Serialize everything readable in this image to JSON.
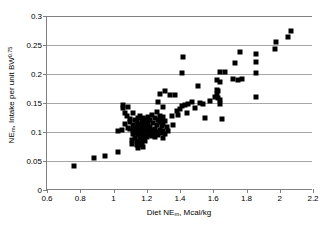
{
  "chart_data": {
    "type": "scatter",
    "title": "",
    "xlabel": "Diet NEm, Mcal/kg",
    "ylabel": "NEm Intake per unit BW0.75",
    "xlabel_parts": {
      "pre": "Diet NE",
      "sub": "m",
      "post": ", Mcal/kg"
    },
    "ylabel_parts": {
      "pre": "NE",
      "sub": "m",
      "mid": ", Intake per unit BW",
      "sup": "0.75"
    },
    "xlim": [
      0.6,
      2.2
    ],
    "ylim": [
      0,
      0.3
    ],
    "xticks": [
      0.6,
      0.8,
      1,
      1.2,
      1.4,
      1.6,
      1.8,
      2,
      2.2
    ],
    "xtick_labels": [
      "0.6",
      "0.8",
      "1",
      "1.2",
      "1.4",
      "1.6",
      "1.8",
      "2",
      "2.2"
    ],
    "yticks": [
      0,
      0.05,
      0.1,
      0.15,
      0.2,
      0.25,
      0.3
    ],
    "ytick_labels": [
      "0",
      "0.05",
      "0.1",
      "0.15",
      "0.2",
      "0.25",
      "0.3"
    ],
    "grid": "horizontal",
    "legend": null,
    "marker": "square",
    "marker_color": "#000000",
    "marker_size_px": 5,
    "gridline_color": "#a6a6a6",
    "axis_color": "#808080",
    "n_points": 139,
    "points": [
      [
        0.76,
        0.041
      ],
      [
        0.88,
        0.056
      ],
      [
        0.95,
        0.058
      ],
      [
        1.03,
        0.066
      ],
      [
        1.03,
        0.102
      ],
      [
        1.05,
        0.103
      ],
      [
        1.06,
        0.141
      ],
      [
        1.06,
        0.146
      ],
      [
        1.07,
        0.132
      ],
      [
        1.07,
        0.113
      ],
      [
        1.08,
        0.127
      ],
      [
        1.09,
        0.107
      ],
      [
        1.09,
        0.143
      ],
      [
        1.1,
        0.106
      ],
      [
        1.1,
        0.118
      ],
      [
        1.1,
        0.123
      ],
      [
        1.11,
        0.086
      ],
      [
        1.11,
        0.079
      ],
      [
        1.12,
        0.096
      ],
      [
        1.12,
        0.104
      ],
      [
        1.12,
        0.112
      ],
      [
        1.12,
        0.133
      ],
      [
        1.13,
        0.09
      ],
      [
        1.13,
        0.101
      ],
      [
        1.13,
        0.108
      ],
      [
        1.13,
        0.12
      ],
      [
        1.14,
        0.078
      ],
      [
        1.14,
        0.085
      ],
      [
        1.14,
        0.098
      ],
      [
        1.14,
        0.106
      ],
      [
        1.14,
        0.117
      ],
      [
        1.15,
        0.073
      ],
      [
        1.15,
        0.082
      ],
      [
        1.15,
        0.094
      ],
      [
        1.15,
        0.102
      ],
      [
        1.15,
        0.11
      ],
      [
        1.15,
        0.124
      ],
      [
        1.16,
        0.077
      ],
      [
        1.16,
        0.089
      ],
      [
        1.16,
        0.099
      ],
      [
        1.16,
        0.105
      ],
      [
        1.16,
        0.113
      ],
      [
        1.16,
        0.128
      ],
      [
        1.17,
        0.081
      ],
      [
        1.17,
        0.092
      ],
      [
        1.17,
        0.1
      ],
      [
        1.17,
        0.108
      ],
      [
        1.17,
        0.119
      ],
      [
        1.18,
        0.075
      ],
      [
        1.18,
        0.087
      ],
      [
        1.18,
        0.097
      ],
      [
        1.18,
        0.104
      ],
      [
        1.18,
        0.115
      ],
      [
        1.18,
        0.125
      ],
      [
        1.19,
        0.084
      ],
      [
        1.19,
        0.093
      ],
      [
        1.19,
        0.103
      ],
      [
        1.19,
        0.111
      ],
      [
        1.19,
        0.122
      ],
      [
        1.2,
        0.091
      ],
      [
        1.2,
        0.101
      ],
      [
        1.2,
        0.109
      ],
      [
        1.2,
        0.118
      ],
      [
        1.21,
        0.095
      ],
      [
        1.21,
        0.105
      ],
      [
        1.21,
        0.114
      ],
      [
        1.21,
        0.126
      ],
      [
        1.22,
        0.099
      ],
      [
        1.22,
        0.108
      ],
      [
        1.22,
        0.121
      ],
      [
        1.23,
        0.093
      ],
      [
        1.23,
        0.103
      ],
      [
        1.23,
        0.13
      ],
      [
        1.24,
        0.098
      ],
      [
        1.24,
        0.116
      ],
      [
        1.25,
        0.091
      ],
      [
        1.25,
        0.106
      ],
      [
        1.25,
        0.124
      ],
      [
        1.26,
        0.1
      ],
      [
        1.26,
        0.112
      ],
      [
        1.26,
        0.134
      ],
      [
        1.27,
        0.095
      ],
      [
        1.27,
        0.121
      ],
      [
        1.27,
        0.152
      ],
      [
        1.28,
        0.104
      ],
      [
        1.28,
        0.117
      ],
      [
        1.28,
        0.128
      ],
      [
        1.28,
        0.166
      ],
      [
        1.29,
        0.098
      ],
      [
        1.29,
        0.11
      ],
      [
        1.29,
        0.123
      ],
      [
        1.3,
        0.09
      ],
      [
        1.3,
        0.102
      ],
      [
        1.3,
        0.114
      ],
      [
        1.3,
        0.126
      ],
      [
        1.3,
        0.143
      ],
      [
        1.31,
        0.096
      ],
      [
        1.31,
        0.119
      ],
      [
        1.31,
        0.171
      ],
      [
        1.32,
        0.108
      ],
      [
        1.33,
        0.101
      ],
      [
        1.34,
        0.163
      ],
      [
        1.35,
        0.128
      ],
      [
        1.36,
        0.112
      ],
      [
        1.37,
        0.164
      ],
      [
        1.38,
        0.136
      ],
      [
        1.39,
        0.13
      ],
      [
        1.4,
        0.14
      ],
      [
        1.41,
        0.144
      ],
      [
        1.41,
        0.201
      ],
      [
        1.42,
        0.23
      ],
      [
        1.43,
        0.146
      ],
      [
        1.44,
        0.133
      ],
      [
        1.45,
        0.149
      ],
      [
        1.47,
        0.152
      ],
      [
        1.49,
        0.141
      ],
      [
        1.51,
        0.179
      ],
      [
        1.52,
        0.15
      ],
      [
        1.54,
        0.148
      ],
      [
        1.55,
        0.125
      ],
      [
        1.58,
        0.153
      ],
      [
        1.61,
        0.16
      ],
      [
        1.62,
        0.173
      ],
      [
        1.62,
        0.166
      ],
      [
        1.62,
        0.19
      ],
      [
        1.63,
        0.158
      ],
      [
        1.63,
        0.17
      ],
      [
        1.64,
        0.148
      ],
      [
        1.64,
        0.155
      ],
      [
        1.64,
        0.187
      ],
      [
        1.64,
        0.203
      ],
      [
        1.65,
        0.122
      ],
      [
        1.67,
        0.203
      ],
      [
        1.72,
        0.192
      ],
      [
        1.73,
        0.219
      ],
      [
        1.75,
        0.19
      ],
      [
        1.76,
        0.238
      ],
      [
        1.77,
        0.191
      ],
      [
        1.86,
        0.161
      ],
      [
        1.86,
        0.202
      ],
      [
        1.86,
        0.221
      ],
      [
        1.86,
        0.234
      ],
      [
        1.97,
        0.243
      ],
      [
        1.98,
        0.255
      ],
      [
        2.05,
        0.263
      ],
      [
        2.07,
        0.275
      ]
    ]
  }
}
